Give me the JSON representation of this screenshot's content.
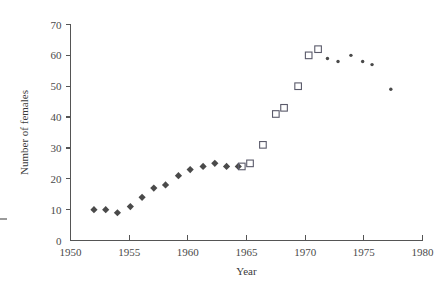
{
  "chart_data": {
    "type": "scatter",
    "title": "",
    "xlabel": "Year",
    "ylabel": "Number of females",
    "xlim": [
      1950,
      1980
    ],
    "ylim": [
      0,
      70
    ],
    "xticks": [
      1950,
      1955,
      1960,
      1965,
      1970,
      1975,
      1980
    ],
    "xtick_labels": [
      "1950",
      "1955",
      "1960",
      "1965",
      "1970",
      "1975",
      "1980"
    ],
    "yticks": [
      0,
      10,
      20,
      30,
      40,
      50,
      60,
      70
    ],
    "ytick_labels": [
      "0",
      "10",
      "20",
      "30",
      "40",
      "50",
      "60",
      "70"
    ],
    "grid": false,
    "legend": "none",
    "series": [
      {
        "name": "filled-diamonds",
        "marker": "diamond",
        "color": "#4a4a4a",
        "points": [
          {
            "x": 1952.0,
            "y": 10
          },
          {
            "x": 1953.0,
            "y": 10
          },
          {
            "x": 1954.0,
            "y": 9
          },
          {
            "x": 1955.1,
            "y": 11
          },
          {
            "x": 1956.1,
            "y": 14
          },
          {
            "x": 1957.1,
            "y": 17
          },
          {
            "x": 1958.1,
            "y": 18
          },
          {
            "x": 1959.2,
            "y": 21
          },
          {
            "x": 1960.2,
            "y": 23
          },
          {
            "x": 1961.3,
            "y": 24
          },
          {
            "x": 1962.3,
            "y": 25
          },
          {
            "x": 1963.3,
            "y": 24
          },
          {
            "x": 1964.3,
            "y": 24
          }
        ]
      },
      {
        "name": "open-squares",
        "marker": "square",
        "color": "#5a5a6a",
        "points": [
          {
            "x": 1964.6,
            "y": 24
          },
          {
            "x": 1965.3,
            "y": 25
          },
          {
            "x": 1966.4,
            "y": 31
          },
          {
            "x": 1967.5,
            "y": 41
          },
          {
            "x": 1968.2,
            "y": 43
          },
          {
            "x": 1969.4,
            "y": 50
          },
          {
            "x": 1970.3,
            "y": 60
          },
          {
            "x": 1971.1,
            "y": 62
          }
        ]
      },
      {
        "name": "small-dots",
        "marker": "dot",
        "color": "#4a4a4a",
        "points": [
          {
            "x": 1971.9,
            "y": 59
          },
          {
            "x": 1972.8,
            "y": 58
          },
          {
            "x": 1973.9,
            "y": 60
          },
          {
            "x": 1974.9,
            "y": 58
          },
          {
            "x": 1975.7,
            "y": 57
          },
          {
            "x": 1977.3,
            "y": 49
          }
        ]
      }
    ]
  },
  "axes": {
    "xlabel": "Year",
    "ylabel": "Number of females"
  }
}
